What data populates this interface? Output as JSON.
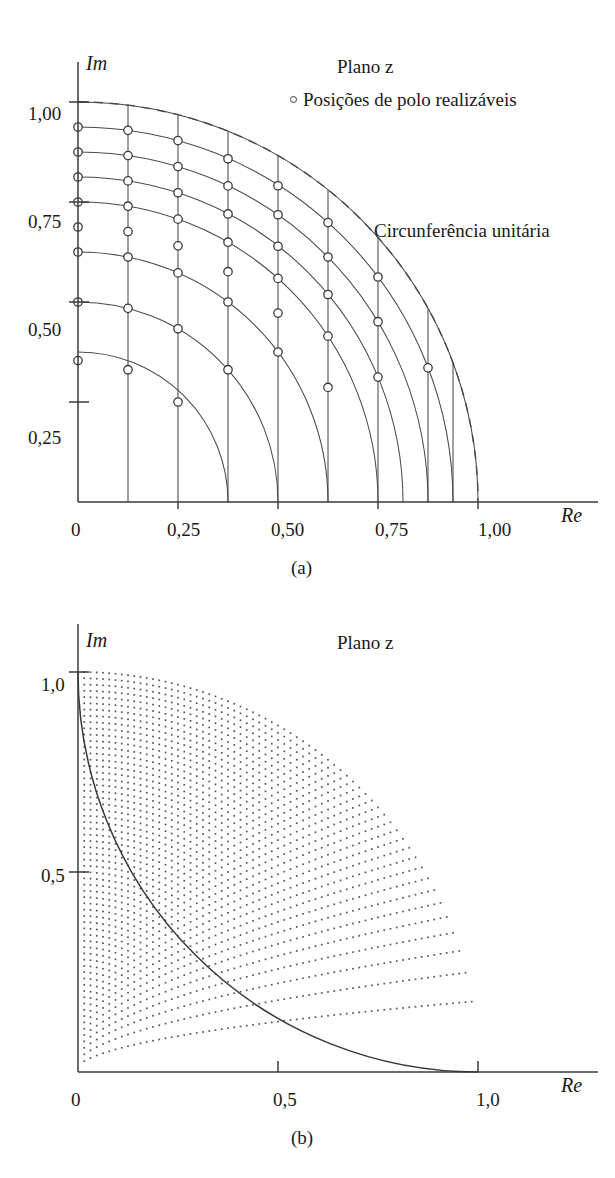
{
  "figure_a": {
    "caption": "(a)",
    "plane_title": "Plano z",
    "legend_label": "Posições de polo realizáveis",
    "legend_marker": "open-circle-marker",
    "annotation": "Circunferência unitária",
    "axis": {
      "x_name": "Re",
      "y_name": "Im",
      "x_ticks": [
        "0",
        "0,25",
        "0,50",
        "0,75",
        "1,00"
      ],
      "x_tick_values": [
        0,
        0.25,
        0.5,
        0.75,
        1.0
      ],
      "y_ticks": [
        "0,25",
        "0,50",
        "0,75",
        "1,00"
      ],
      "y_tick_values": [
        0.25,
        0.5,
        0.75,
        1.0
      ]
    }
  },
  "figure_b": {
    "caption": "(b)",
    "plane_title": "Plano z",
    "axis": {
      "x_name": "Re",
      "y_name": "Im",
      "x_ticks": [
        "0",
        "0,5",
        "1,0"
      ],
      "x_tick_values": [
        0,
        0.5,
        1.0
      ],
      "y_ticks": [
        "0,5",
        "1,0"
      ],
      "y_tick_values": [
        0.5,
        1.0
      ]
    }
  },
  "colors": {
    "background": "#ffffff",
    "ink": "#1a1a1a",
    "line": "#4a4a4a",
    "axis": "#3a3a3a",
    "dot": "#555555"
  },
  "chart_data": [
    {
      "id": "a",
      "type": "scatter",
      "title": "Plano z",
      "xlabel": "Re",
      "ylabel": "Im",
      "xlim": [
        0,
        1.12
      ],
      "ylim": [
        0,
        1.08
      ],
      "grid": true,
      "legend": [
        "Posições de polo realizáveis"
      ],
      "legend_position": "top-right",
      "annotations": [
        "Circunferência unitária"
      ],
      "description": "First-quadrant z-plane grid. Vertical lines at constant real part Re = k/8 and circular arcs at constant radius r = k/8 (k = 1..8). Realizable pole positions are marked with open circles at the intersections of the vertical lines with the arcs.",
      "real_part_gridlines": [
        0.125,
        0.25,
        0.375,
        0.5,
        0.625,
        0.75,
        0.875,
        1.0
      ],
      "radius_arcs": [
        0.375,
        0.5,
        0.625,
        0.75,
        0.8125,
        0.875,
        0.9375,
        1.0
      ],
      "unit_circle_radius": 1.0,
      "unit_circle_style": "dashed",
      "poles": [
        {
          "re": 0.0,
          "im": 0.9375
        },
        {
          "re": 0.125,
          "im": 0.9291
        },
        {
          "re": 0.25,
          "im": 0.9035
        },
        {
          "re": 0.375,
          "im": 0.858
        },
        {
          "re": 0.5,
          "im": 0.7906
        },
        {
          "re": 0.625,
          "im": 0.6985
        },
        {
          "re": 0.75,
          "im": 0.5625
        },
        {
          "re": 0.875,
          "im": 0.3354
        },
        {
          "re": 0.0,
          "im": 0.875
        },
        {
          "re": 0.125,
          "im": 0.866
        },
        {
          "re": 0.25,
          "im": 0.8385
        },
        {
          "re": 0.375,
          "im": 0.7902
        },
        {
          "re": 0.5,
          "im": 0.7181
        },
        {
          "re": 0.625,
          "im": 0.6124
        },
        {
          "re": 0.75,
          "im": 0.4507
        },
        {
          "re": 0.0,
          "im": 0.8125
        },
        {
          "re": 0.125,
          "im": 0.8028
        },
        {
          "re": 0.25,
          "im": 0.773
        },
        {
          "re": 0.375,
          "im": 0.7201
        },
        {
          "re": 0.5,
          "im": 0.6394
        },
        {
          "re": 0.625,
          "im": 0.5188
        },
        {
          "re": 0.75,
          "im": 0.3122
        },
        {
          "re": 0.0,
          "im": 0.75
        },
        {
          "re": 0.125,
          "im": 0.7395
        },
        {
          "re": 0.25,
          "im": 0.7071
        },
        {
          "re": 0.375,
          "im": 0.6495
        },
        {
          "re": 0.5,
          "im": 0.559
        },
        {
          "re": 0.625,
          "im": 0.4146
        },
        {
          "re": 0.0,
          "im": 0.6875
        },
        {
          "re": 0.125,
          "im": 0.676
        },
        {
          "re": 0.25,
          "im": 0.6404
        },
        {
          "re": 0.375,
          "im": 0.5758
        },
        {
          "re": 0.5,
          "im": 0.4723
        },
        {
          "re": 0.625,
          "im": 0.2864
        },
        {
          "re": 0.0,
          "im": 0.625
        },
        {
          "re": 0.125,
          "im": 0.6124
        },
        {
          "re": 0.25,
          "im": 0.5728
        },
        {
          "re": 0.375,
          "im": 0.5
        },
        {
          "re": 0.5,
          "im": 0.375
        },
        {
          "re": 0.0,
          "im": 0.5
        },
        {
          "re": 0.125,
          "im": 0.4841
        },
        {
          "re": 0.25,
          "im": 0.433
        },
        {
          "re": 0.375,
          "im": 0.3307
        },
        {
          "re": 0.0,
          "im": 0.3536
        },
        {
          "re": 0.125,
          "im": 0.3307
        },
        {
          "re": 0.25,
          "im": 0.25
        }
      ]
    },
    {
      "id": "b",
      "type": "scatter",
      "title": "Plano z",
      "xlabel": "Re",
      "ylabel": "Im",
      "xlim": [
        0,
        1.12
      ],
      "ylim": [
        0,
        1.08
      ],
      "grid": false,
      "legend": [],
      "annotations": [],
      "description": "First-quadrant z-plane with a dense set of realizable pole positions. Dots lie on a fine grid of vertical lines of constant real part and circular arcs of constant radius, becoming sparse near the real axis and dense near the unit circle. The unit circle is drawn as a solid arc.",
      "unit_circle_radius": 1.0,
      "unit_circle_style": "solid",
      "grid_resolution": {
        "real_part_divisions": 64,
        "radius_divisions": 64
      },
      "dot_count_approx": 2100
    }
  ]
}
